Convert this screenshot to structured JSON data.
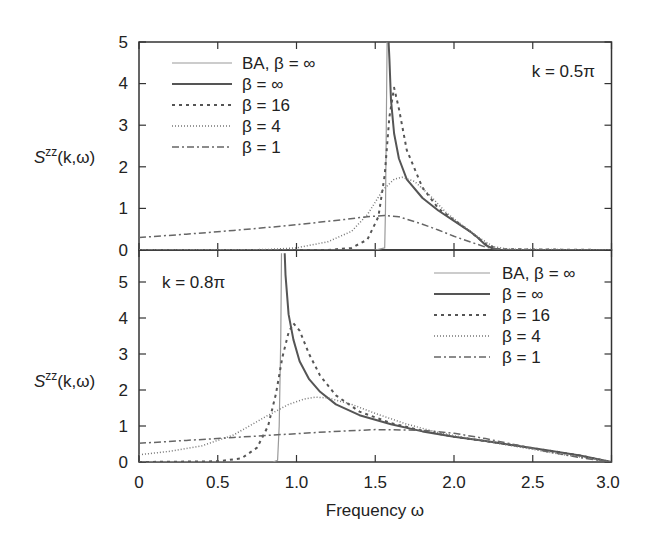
{
  "chart_data": [
    {
      "type": "line",
      "panel": "top",
      "annotation": "k = 0.5π",
      "ylabel": "S^zz(k,ω)",
      "xlabel": "",
      "xlim": [
        0,
        3.0
      ],
      "ylim": [
        0,
        5
      ],
      "yticks": [
        0,
        1,
        2,
        3,
        4,
        5
      ],
      "xticks": [
        0,
        0.5,
        1.0,
        1.5,
        2.0,
        2.5,
        3.0
      ],
      "legend_position": "upper left",
      "series": [
        {
          "name": "BA, β = ∞",
          "style": "thin-solid-gray",
          "x": [
            0,
            1.5,
            1.56,
            1.565,
            1.57,
            1.575
          ],
          "y": [
            0,
            0,
            0.05,
            1.0,
            3.0,
            5.0
          ]
        },
        {
          "name": "β = ∞",
          "style": "solid",
          "x": [
            1.585,
            1.59,
            1.6,
            1.62,
            1.65,
            1.7,
            1.8,
            1.9,
            2.0,
            2.1,
            2.15,
            2.2,
            2.25,
            2.3,
            3.0
          ],
          "y": [
            5.0,
            4.6,
            3.6,
            2.8,
            2.2,
            1.7,
            1.25,
            0.95,
            0.7,
            0.45,
            0.3,
            0.12,
            0.03,
            0.0,
            0.0
          ]
        },
        {
          "name": "β = 16",
          "style": "dashed",
          "x": [
            0,
            1.2,
            1.35,
            1.45,
            1.52,
            1.56,
            1.59,
            1.62,
            1.65,
            1.7,
            1.8,
            1.9,
            2.0,
            2.1,
            2.2,
            2.28,
            3.0
          ],
          "y": [
            0,
            0,
            0.05,
            0.25,
            0.8,
            1.8,
            3.2,
            3.9,
            3.4,
            2.4,
            1.5,
            1.0,
            0.72,
            0.45,
            0.15,
            0.02,
            0.0
          ]
        },
        {
          "name": "β = 4",
          "style": "dotted",
          "x": [
            0,
            0.8,
            1.0,
            1.2,
            1.35,
            1.45,
            1.55,
            1.62,
            1.67,
            1.75,
            1.85,
            1.95,
            2.05,
            2.15,
            2.25,
            2.35,
            3.0
          ],
          "y": [
            0,
            0.01,
            0.05,
            0.2,
            0.45,
            0.85,
            1.45,
            1.7,
            1.75,
            1.65,
            1.3,
            0.9,
            0.6,
            0.32,
            0.08,
            0.02,
            0.0
          ]
        },
        {
          "name": "β = 1",
          "style": "dash-dot",
          "x": [
            0,
            0.3,
            0.6,
            0.9,
            1.1,
            1.3,
            1.45,
            1.56,
            1.65,
            1.8,
            1.9,
            2.0,
            2.1,
            2.2,
            2.3,
            3.0
          ],
          "y": [
            0.3,
            0.38,
            0.47,
            0.57,
            0.65,
            0.73,
            0.8,
            0.83,
            0.8,
            0.62,
            0.48,
            0.33,
            0.2,
            0.07,
            0.01,
            0.0
          ]
        }
      ]
    },
    {
      "type": "line",
      "panel": "bottom",
      "annotation": "k = 0.8π",
      "ylabel": "S^zz(k,ω)",
      "xlabel": "Frequency ω",
      "xlim": [
        0,
        3.0
      ],
      "ylim": [
        0,
        5.8
      ],
      "yticks": [
        0,
        1,
        2,
        3,
        4,
        5
      ],
      "xticks": [
        0,
        0.5,
        1.0,
        1.5,
        2.0,
        2.5,
        3.0
      ],
      "legend_position": "upper right",
      "series": [
        {
          "name": "BA, β = ∞",
          "style": "thin-solid-gray",
          "x": [
            0,
            0.85,
            0.88,
            0.89,
            0.9,
            0.905
          ],
          "y": [
            0,
            0,
            0.05,
            1.0,
            3.5,
            5.8
          ]
        },
        {
          "name": "β = ∞",
          "style": "solid",
          "x": [
            0.925,
            0.93,
            0.95,
            0.98,
            1.02,
            1.08,
            1.15,
            1.25,
            1.4,
            1.6,
            1.8,
            2.0,
            2.2,
            2.4,
            2.6,
            2.8,
            3.0
          ],
          "y": [
            5.8,
            5.2,
            4.1,
            3.4,
            2.8,
            2.3,
            1.95,
            1.6,
            1.3,
            1.05,
            0.85,
            0.7,
            0.58,
            0.45,
            0.32,
            0.18,
            0.0
          ]
        },
        {
          "name": "β = 16",
          "style": "dashed",
          "x": [
            0,
            0.5,
            0.65,
            0.75,
            0.82,
            0.87,
            0.91,
            0.95,
            0.98,
            1.02,
            1.08,
            1.15,
            1.25,
            1.4,
            1.6,
            1.8,
            2.0,
            2.2,
            2.4,
            2.6,
            2.8,
            3.0
          ],
          "y": [
            0,
            0.02,
            0.1,
            0.4,
            1.0,
            1.9,
            2.9,
            3.6,
            3.85,
            3.65,
            3.0,
            2.4,
            1.85,
            1.4,
            1.08,
            0.87,
            0.7,
            0.58,
            0.45,
            0.32,
            0.18,
            0.0
          ]
        },
        {
          "name": "β = 4",
          "style": "dotted",
          "x": [
            0,
            0.2,
            0.4,
            0.6,
            0.8,
            0.95,
            1.05,
            1.12,
            1.2,
            1.35,
            1.5,
            1.7,
            1.9,
            2.1,
            2.3,
            2.5,
            2.7,
            2.9,
            3.0
          ],
          "y": [
            0.2,
            0.3,
            0.45,
            0.75,
            1.25,
            1.6,
            1.75,
            1.8,
            1.78,
            1.6,
            1.35,
            1.05,
            0.82,
            0.65,
            0.5,
            0.35,
            0.2,
            0.08,
            0.0
          ]
        },
        {
          "name": "β = 1",
          "style": "dash-dot",
          "x": [
            0,
            0.3,
            0.6,
            0.9,
            1.2,
            1.5,
            1.8,
            2.0,
            2.2,
            2.4,
            2.6,
            2.8,
            3.0
          ],
          "y": [
            0.52,
            0.6,
            0.68,
            0.76,
            0.84,
            0.9,
            0.88,
            0.8,
            0.65,
            0.47,
            0.28,
            0.12,
            0.0
          ]
        }
      ]
    }
  ],
  "figure": {
    "top_annotation": "k = 0.5π",
    "bottom_annotation": "k = 0.8π",
    "xlabel": "Frequency ω",
    "ylabel_main": "S",
    "ylabel_sup": "zz",
    "ylabel_args": "(k,ω)",
    "x_tick_labels": [
      "0",
      "0.5",
      "1.0",
      "1.5",
      "2.0",
      "2.5",
      "3.0"
    ],
    "top_y_tick_labels": [
      "0",
      "1",
      "2",
      "3",
      "4",
      "5"
    ],
    "bottom_y_tick_labels": [
      "0",
      "1",
      "2",
      "3",
      "4",
      "5"
    ],
    "legend": [
      "BA, β = ∞",
      "β = ∞",
      "β = 16",
      "β = 4",
      "β = 1"
    ]
  }
}
